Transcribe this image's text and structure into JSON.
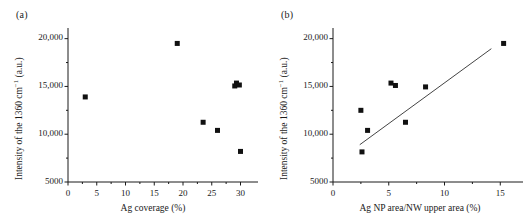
{
  "figure": {
    "background": "#ffffff",
    "ink": "#1a1a1a",
    "marker_color": "#111111",
    "line_color": "#444444"
  },
  "panels": [
    {
      "key": "a",
      "label": "(a)",
      "chart_data": {
        "type": "scatter",
        "title": "",
        "xlabel": "Ag coverage (%)",
        "ylabel_plain": "Intensity of the 1360 cm-1 (a.u.)",
        "ylabel_pre": "Intensity of the 1360 cm",
        "ylabel_sup": "−1",
        "ylabel_post": " (a.u.)",
        "xlim": [
          0,
          32
        ],
        "ylim": [
          5000,
          20800
        ],
        "xticks": [
          0,
          5,
          10,
          15,
          20,
          25,
          30
        ],
        "xtick_labels": [
          "0",
          "5",
          "10",
          "15",
          "20",
          "25",
          "30"
        ],
        "yticks": [
          5000,
          10000,
          15000,
          20000
        ],
        "ytick_labels": [
          "5000",
          "10,000",
          "15,000",
          "20,000"
        ],
        "grid": false,
        "legend": null,
        "x": [
          3.0,
          19.0,
          23.5,
          26.0,
          29.0,
          29.3,
          29.8,
          30.0
        ],
        "y": [
          13900,
          19500,
          11250,
          10400,
          15050,
          15350,
          15150,
          8200
        ],
        "points": [
          {
            "x": 3.0,
            "y": 13900
          },
          {
            "x": 19.0,
            "y": 19500
          },
          {
            "x": 23.5,
            "y": 11250
          },
          {
            "x": 26.0,
            "y": 10400
          },
          {
            "x": 29.0,
            "y": 15050
          },
          {
            "x": 29.3,
            "y": 15350
          },
          {
            "x": 29.8,
            "y": 15150
          },
          {
            "x": 30.0,
            "y": 8200
          }
        ],
        "fit_line": null
      }
    },
    {
      "key": "b",
      "label": "(b)",
      "chart_data": {
        "type": "scatter",
        "title": "",
        "xlabel": "Ag NP area/NW upper area (%)",
        "ylabel_plain": "Intensity of the 1360 cm-1 (a.u.)",
        "ylabel_pre": "Intensity of the 1360 cm",
        "ylabel_sup": "−1",
        "ylabel_post": " (a.u.)",
        "xlim": [
          0,
          16.5
        ],
        "ylim": [
          5000,
          20800
        ],
        "xticks": [
          0,
          5,
          10,
          15
        ],
        "xtick_labels": [
          "0",
          "5",
          "10",
          "15"
        ],
        "yticks": [
          5000,
          10000,
          15000,
          20000
        ],
        "ytick_labels": [
          "5000",
          "10,000",
          "15,000",
          "20,000"
        ],
        "grid": false,
        "legend": null,
        "x": [
          2.5,
          2.6,
          3.1,
          5.2,
          5.6,
          6.5,
          8.3,
          15.3
        ],
        "y": [
          12500,
          8150,
          10400,
          15350,
          15100,
          11250,
          14950,
          19500
        ],
        "points": [
          {
            "x": 2.5,
            "y": 12500
          },
          {
            "x": 2.6,
            "y": 8150
          },
          {
            "x": 3.1,
            "y": 10400
          },
          {
            "x": 5.2,
            "y": 15350
          },
          {
            "x": 5.6,
            "y": 15100
          },
          {
            "x": 6.5,
            "y": 11250
          },
          {
            "x": 8.3,
            "y": 14950
          },
          {
            "x": 15.3,
            "y": 19500
          }
        ],
        "fit_line": {
          "x1": 2.4,
          "y1": 8900,
          "x2": 14.2,
          "y2": 18950
        }
      }
    }
  ]
}
